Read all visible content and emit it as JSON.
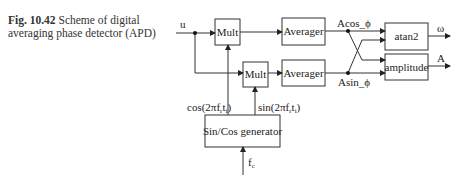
{
  "caption": {
    "fig_label": "Fig. 10.42",
    "text": "Scheme of digital averaging phase detector (APD)"
  },
  "blocks": {
    "mult1": "Mult",
    "mult2": "Mult",
    "averager1": "Averager",
    "averager2": "Averager",
    "atan2": "atan2",
    "amplitude": "amplitude",
    "generator": "Sin/Cos generator"
  },
  "signals": {
    "input": "u",
    "acos": "Acos_ϕ",
    "asin": "Asin_ϕ",
    "omega": "ω",
    "amp_out": "A",
    "cos_ref": "cos(2πf",
    "sin_ref": "sin(2πf",
    "fc": "f"
  }
}
